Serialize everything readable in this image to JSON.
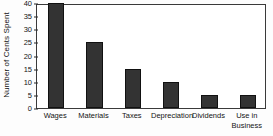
{
  "chart_data": {
    "type": "bar",
    "title": "",
    "xlabel": "",
    "ylabel": "Number of Cents Spent",
    "categories": [
      "Wages",
      "Materials",
      "Taxes",
      "Depreciation",
      "Dividends",
      "Use in Business"
    ],
    "category_lines": [
      [
        "Wages"
      ],
      [
        "Materials"
      ],
      [
        "Taxes"
      ],
      [
        "Depreciation"
      ],
      [
        "Dividends"
      ],
      [
        "Use in",
        "Business"
      ]
    ],
    "values": [
      40,
      25,
      15,
      10,
      5,
      5
    ],
    "ylim": [
      0,
      40
    ],
    "ytick_values": [
      40,
      35,
      30,
      25,
      20,
      15,
      10,
      5,
      0
    ],
    "ytick_labels": [
      "40",
      "35",
      "30",
      "25",
      "20",
      "15",
      "10",
      "5",
      "0"
    ],
    "ytick_step": 5,
    "grid": false,
    "legend": null,
    "bar_color": "#333333",
    "bar_edge_color": "#111111",
    "axis_color": "#3a3a3a",
    "background_color": "#ffffff"
  }
}
